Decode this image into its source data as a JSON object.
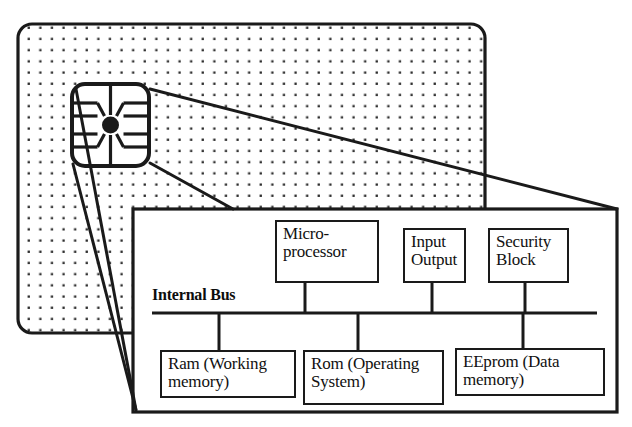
{
  "figure": {
    "title": "Smart card internal architecture"
  },
  "colors": {
    "ink": "#111111",
    "line": "#1a1a1a",
    "paper": "#ffffff",
    "dot": "#2b2b2b"
  },
  "card": {
    "name": "smart-card-body",
    "pattern": "dotted",
    "x": 18,
    "y": 24,
    "width": 467,
    "height": 309,
    "corner_radius": 14
  },
  "chip": {
    "name": "chip-contact-pad",
    "x": 72,
    "y": 84,
    "width": 77,
    "height": 82,
    "corner_radius": 13,
    "contact_rows": 4,
    "has_center_pad": true
  },
  "detail_panel": {
    "name": "magnified-detail-panel",
    "x": 133,
    "y": 209,
    "width": 484,
    "height": 203
  },
  "internal_bus": {
    "label": "Internal Bus",
    "label_x": 152,
    "label_y": 286,
    "line_y": 313,
    "line_x1": 152,
    "line_x2": 597
  },
  "top_blocks": [
    {
      "id": "microprocessor",
      "label": "Micro-\nprocessor",
      "x": 275,
      "y": 220,
      "width": 104,
      "height": 63,
      "connector_x": 305
    },
    {
      "id": "input-output",
      "label": "Input\nOutput",
      "x": 403,
      "y": 228,
      "width": 63,
      "height": 55,
      "connector_x": 432
    },
    {
      "id": "security-block",
      "label": "Security\nBlock",
      "x": 488,
      "y": 228,
      "width": 81,
      "height": 55,
      "connector_x": 525
    }
  ],
  "bottom_blocks": [
    {
      "id": "ram",
      "label": "Ram (Working\nmemory)",
      "x": 160,
      "y": 350,
      "width": 136,
      "height": 48,
      "connector_x": 219
    },
    {
      "id": "rom",
      "label": "Rom (Operating\nSystem)",
      "x": 303,
      "y": 350,
      "width": 141,
      "height": 55,
      "connector_x": 358
    },
    {
      "id": "eeprom",
      "label": "EEprom (Data\nmemory)",
      "x": 455,
      "y": 348,
      "width": 150,
      "height": 48,
      "connector_x": 523
    }
  ],
  "callouts": [
    {
      "id": "callout-top",
      "from_x": 150,
      "from_y": 89,
      "to_x": 617,
      "to_y": 209
    },
    {
      "id": "callout-middle",
      "from_x": 150,
      "from_y": 163,
      "to_x": 233,
      "to_y": 209
    },
    {
      "id": "callout-bottom",
      "from_x": 73,
      "from_y": 164,
      "to_x": 136,
      "to_y": 410
    },
    {
      "id": "callout-chip-diagonal",
      "from_x": 76,
      "from_y": 89,
      "to_x": 136,
      "to_y": 410
    }
  ]
}
